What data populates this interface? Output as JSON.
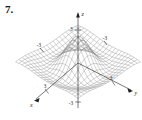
{
  "problem": {
    "number": "7."
  },
  "figure": {
    "name": "3d-surface-plot",
    "axes": {
      "x_label": "x",
      "y_label": "y",
      "z_label": "z"
    },
    "ticks": {
      "z_positive": "3",
      "z_negative": "-3",
      "x_positive": "3",
      "x_negative": "-3",
      "y_positive": "3",
      "y_negative": "-3"
    },
    "colors": {
      "mesh": "#7a7a7a",
      "axis": "#1f1f1f",
      "background": "#ffffff"
    }
  },
  "chart_data": {
    "type": "surface",
    "title": "",
    "xlabel": "x",
    "ylabel": "y",
    "zlabel": "z",
    "xlim": [
      -3,
      3
    ],
    "ylim": [
      -3,
      3
    ],
    "zlim": [
      -3,
      3
    ],
    "grid": true,
    "legend": "none",
    "x_ticks": [
      -3,
      3
    ],
    "y_ticks": [
      -3,
      3
    ],
    "z_ticks": [
      -3,
      3
    ],
    "surface_function": "z = sin(r)/r style ripple, r = sqrt(x^2+y^2)",
    "mesh_divisions": 20
  }
}
